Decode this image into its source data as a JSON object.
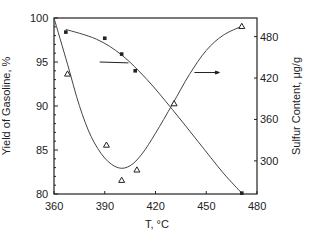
{
  "chart_data": {
    "type": "line",
    "title": "",
    "xlabel": "T, °C",
    "ylabel": "Yield of Gasoline, %",
    "y2label": "Sulfur Content, μg/g",
    "xlim": [
      360,
      480
    ],
    "ylim": [
      80,
      100
    ],
    "y2lim": [
      252,
      507
    ],
    "x_ticks": [
      "360",
      "390",
      "420",
      "450",
      "480"
    ],
    "y_ticks": [
      "80",
      "85",
      "90",
      "95",
      "100"
    ],
    "y2_ticks": [
      "300",
      "360",
      "420",
      "480"
    ],
    "grid": false,
    "legend": "none (arrows indicate axis for each curve)",
    "series": [
      {
        "name": "Yield of Gasoline",
        "axis": "left",
        "marker": "square",
        "points": [
          {
            "x": 367,
            "y": 98.4
          },
          {
            "x": 390,
            "y": 97.7
          },
          {
            "x": 400,
            "y": 95.9
          },
          {
            "x": 408,
            "y": 94.0
          },
          {
            "x": 471,
            "y": 80.1
          }
        ],
        "fit_curve": [
          {
            "x": 367,
            "y": 98.7
          },
          {
            "x": 385,
            "y": 97.6
          },
          {
            "x": 400,
            "y": 95.8
          },
          {
            "x": 415,
            "y": 93.0
          },
          {
            "x": 430,
            "y": 89.6
          },
          {
            "x": 445,
            "y": 86.0
          },
          {
            "x": 460,
            "y": 82.4
          },
          {
            "x": 471,
            "y": 80.1
          }
        ]
      },
      {
        "name": "Sulfur Content",
        "axis": "right",
        "marker": "triangle",
        "points": [
          {
            "x": 368,
            "y": 426
          },
          {
            "x": 391,
            "y": 323
          },
          {
            "x": 400,
            "y": 272
          },
          {
            "x": 409,
            "y": 287
          },
          {
            "x": 431,
            "y": 383
          },
          {
            "x": 471,
            "y": 495
          }
        ],
        "fit_curve": [
          {
            "x": 360,
            "y": 507
          },
          {
            "x": 368,
            "y": 440
          },
          {
            "x": 375,
            "y": 380
          },
          {
            "x": 382,
            "y": 335
          },
          {
            "x": 390,
            "y": 304
          },
          {
            "x": 398,
            "y": 290
          },
          {
            "x": 405,
            "y": 293
          },
          {
            "x": 412,
            "y": 310
          },
          {
            "x": 420,
            "y": 340
          },
          {
            "x": 430,
            "y": 382
          },
          {
            "x": 440,
            "y": 425
          },
          {
            "x": 450,
            "y": 460
          },
          {
            "x": 460,
            "y": 482
          },
          {
            "x": 471,
            "y": 495
          }
        ]
      }
    ],
    "annotations": [
      {
        "type": "arrow",
        "from": {
          "x": 387,
          "y": 95.0
        },
        "to": {
          "x": 404,
          "y": 94.9
        },
        "direction": "left-axis",
        "note": "points to yield curve"
      },
      {
        "type": "arrow",
        "from": {
          "x": 443,
          "y": 428
        },
        "to": {
          "x": 456,
          "y": 428
        },
        "direction": "right-axis",
        "note": "points to sulfur axis"
      }
    ]
  },
  "labels": {
    "xlabel": "T, °C",
    "ylabel_left": "Yield of Gasoline, %",
    "ylabel_right": "Sulfur Content, μg/g",
    "x_ticks": [
      "360",
      "390",
      "420",
      "450",
      "480"
    ],
    "y_ticks": [
      "80",
      "85",
      "90",
      "95",
      "100"
    ],
    "y2_ticks": [
      "300",
      "360",
      "420",
      "480"
    ]
  }
}
